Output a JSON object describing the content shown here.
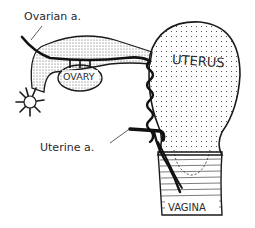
{
  "diagram": {
    "labels": {
      "ovarian_artery": "Ovarian a.",
      "ovary": "OVARY",
      "uterus": "UTERUS",
      "uterine_artery": "Uterine a.",
      "vagina": "VAGINA"
    },
    "colors": {
      "ink": "#1a1a1a",
      "background": "#ffffff"
    }
  }
}
